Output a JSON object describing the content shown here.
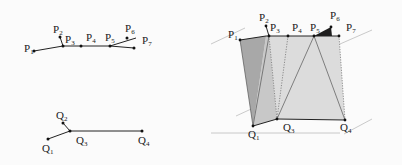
{
  "figure": {
    "left_top": {
      "name": "polyline-P",
      "points": [
        {
          "label": "P",
          "sub": "1"
        },
        {
          "label": "P",
          "sub": "2"
        },
        {
          "label": "P",
          "sub": "3"
        },
        {
          "label": "P",
          "sub": "4"
        },
        {
          "label": "P",
          "sub": "5"
        },
        {
          "label": "P",
          "sub": "6"
        },
        {
          "label": "P",
          "sub": "7"
        }
      ]
    },
    "left_bottom": {
      "name": "polyline-Q",
      "points": [
        {
          "label": "Q",
          "sub": "1"
        },
        {
          "label": "Q",
          "sub": "2"
        },
        {
          "label": "Q",
          "sub": "3"
        },
        {
          "label": "Q",
          "sub": "4"
        }
      ]
    },
    "right": {
      "name": "triangulated-surface",
      "top_points": [
        {
          "label": "P",
          "sub": "1"
        },
        {
          "label": "P",
          "sub": "2"
        },
        {
          "label": "P",
          "sub": "3"
        },
        {
          "label": "P",
          "sub": "4"
        },
        {
          "label": "P",
          "sub": "5"
        },
        {
          "label": "P",
          "sub": "6"
        },
        {
          "label": "P",
          "sub": "7"
        }
      ],
      "bottom_points": [
        {
          "label": "Q",
          "sub": "1"
        },
        {
          "label": "Q",
          "sub": "3"
        },
        {
          "label": "Q",
          "sub": "4"
        }
      ]
    },
    "colors": {
      "dark_face": "#a9a9a9",
      "light_face": "#d9d9d9",
      "mid_face": "#c4c4c4",
      "black_triangle": "#1e1e1e",
      "plane_line": "#bdbdbd"
    }
  }
}
